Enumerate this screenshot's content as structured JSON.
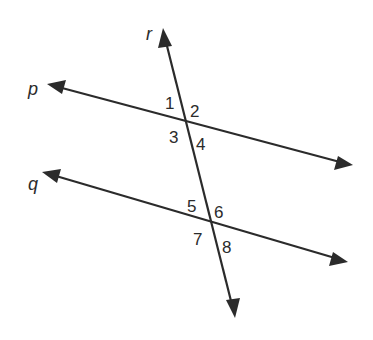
{
  "diagram": {
    "colors": {
      "line": "#2b2b2b",
      "background": "#ffffff"
    },
    "lines": {
      "p": {
        "label": "p"
      },
      "q": {
        "label": "q"
      },
      "r": {
        "label": "r"
      }
    },
    "angles": {
      "a1": "1",
      "a2": "2",
      "a3": "3",
      "a4": "4",
      "a5": "5",
      "a6": "6",
      "a7": "7",
      "a8": "8"
    }
  }
}
